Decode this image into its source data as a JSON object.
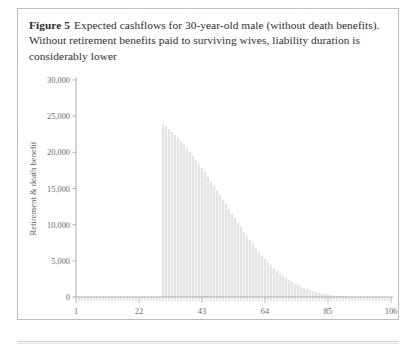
{
  "figure": {
    "label": "Figure 5",
    "caption": "Expected cashflows for 30-year-old male (without death benefits). Without retirement benefits paid to surviving wives, liability duration is considerably lower"
  },
  "chart_data": {
    "type": "bar",
    "title": "Expected cashflows for 30-year-old male (without death benefits). Without retirement benefits paid to surviving wives, liability duration is considerably lower",
    "xlabel": "Years ahead",
    "ylabel": "Retirement & death benefit",
    "xlim": [
      1,
      106
    ],
    "ylim": [
      0,
      30000
    ],
    "xticks": [
      1,
      22,
      43,
      64,
      85,
      106
    ],
    "xticklabels": [
      "1",
      "22",
      "43",
      "64",
      "85",
      "106"
    ],
    "yticks": [
      0,
      5000,
      10000,
      15000,
      20000,
      25000,
      30000
    ],
    "yticklabels": [
      "0",
      "5,000",
      "10,000",
      "15,000",
      "20,000",
      "25,000",
      "30,000"
    ],
    "grid": false,
    "legend": false,
    "bar_color": "#e8e8e8",
    "bar_edge_color": "#d4d4d4",
    "x": [
      1,
      2,
      3,
      4,
      5,
      6,
      7,
      8,
      9,
      10,
      11,
      12,
      13,
      14,
      15,
      16,
      17,
      18,
      19,
      20,
      21,
      22,
      23,
      24,
      25,
      26,
      27,
      28,
      29,
      30,
      31,
      32,
      33,
      34,
      35,
      36,
      37,
      38,
      39,
      40,
      41,
      42,
      43,
      44,
      45,
      46,
      47,
      48,
      49,
      50,
      51,
      52,
      53,
      54,
      55,
      56,
      57,
      58,
      59,
      60,
      61,
      62,
      63,
      64,
      65,
      66,
      67,
      68,
      69,
      70,
      71,
      72,
      73,
      74,
      75,
      76,
      77,
      78,
      79,
      80,
      81,
      82,
      83,
      84,
      85,
      86,
      87,
      88,
      89,
      90,
      91,
      92,
      93,
      94,
      95,
      96,
      97,
      98,
      99,
      100,
      101,
      102,
      103,
      104,
      105,
      106
    ],
    "values": [
      0,
      0,
      0,
      0,
      0,
      0,
      0,
      0,
      0,
      0,
      0,
      0,
      0,
      0,
      0,
      0,
      0,
      0,
      0,
      0,
      0,
      0,
      0,
      0,
      0,
      0,
      0,
      0,
      0,
      23900,
      23550,
      23180,
      22790,
      22380,
      21950,
      21500,
      21030,
      20540,
      20030,
      19500,
      18950,
      18380,
      17800,
      17200,
      16590,
      15970,
      15340,
      14700,
      14060,
      13410,
      12760,
      12110,
      11470,
      10830,
      10200,
      9580,
      8970,
      8380,
      7800,
      7240,
      6700,
      6180,
      5680,
      5200,
      4750,
      4320,
      3920,
      3540,
      3190,
      2870,
      2560,
      2280,
      2020,
      1780,
      1560,
      1360,
      1180,
      1010,
      860,
      720,
      600,
      490,
      395,
      312,
      242,
      184,
      136,
      98,
      68,
      46,
      30,
      19,
      11,
      6,
      3,
      2,
      1,
      0,
      0,
      0,
      0,
      0,
      0,
      0,
      0,
      0
    ]
  }
}
